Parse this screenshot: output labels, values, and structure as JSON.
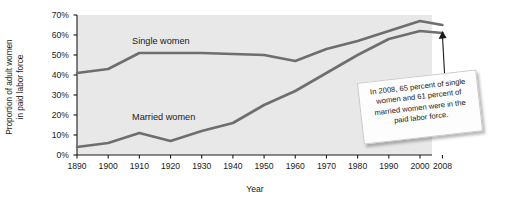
{
  "chart_data": {
    "type": "line",
    "title": "",
    "subtitle": "",
    "xlabel": "Year",
    "ylabel": "Proportion of adult women\nin paid labor force",
    "x": [
      1890,
      1900,
      1910,
      1920,
      1930,
      1940,
      1950,
      1960,
      1970,
      1980,
      1990,
      2000,
      2008
    ],
    "xtick_labels": [
      "1890",
      "1900",
      "1910",
      "1920",
      "1930",
      "1940",
      "1950",
      "1960",
      "1970",
      "1980",
      "1990",
      "2000",
      "2008"
    ],
    "ytick_labels": [
      "0%",
      "10%",
      "20%",
      "30%",
      "40%",
      "50%",
      "60%",
      "70%"
    ],
    "ytick_values": [
      0,
      10,
      20,
      30,
      40,
      50,
      60,
      70
    ],
    "xlim": [
      1890,
      2008
    ],
    "ylim": [
      0,
      70
    ],
    "grid": false,
    "legend_position": "inline-annotation",
    "series": [
      {
        "name": "Single women",
        "color": "#6e6e6e",
        "values": [
          41,
          43,
          51,
          51,
          51,
          50.5,
          50,
          47,
          53,
          57,
          62,
          67,
          65
        ]
      },
      {
        "name": "Married women",
        "color": "#6e6e6e",
        "values": [
          4,
          6,
          11,
          7,
          12,
          16,
          25,
          32,
          41,
          50,
          58,
          62,
          61
        ]
      }
    ],
    "annotations": [
      {
        "name": "callout-2008",
        "text": "In 2008, 65 percent of single women and 61 percent of married women were in the paid labor force.",
        "points_to_year": 2008,
        "points_to_value": 65
      }
    ]
  },
  "plot": {
    "background_color": "#e8e8e8",
    "axis_color": "#1a1a1a",
    "line_color": "#6e6e6e"
  }
}
